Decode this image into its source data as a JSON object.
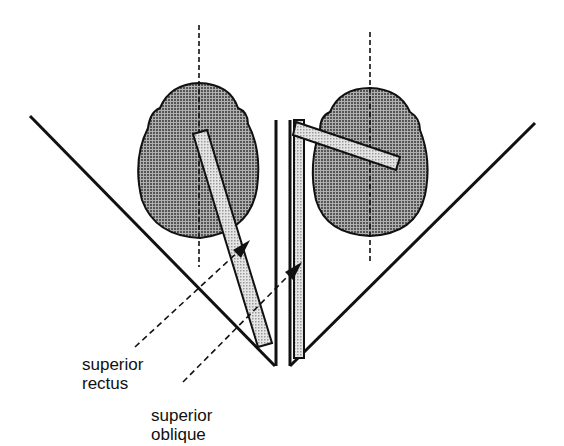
{
  "figure": {
    "type": "anatomical-diagram",
    "colors": {
      "outline": "#111111",
      "eyeball_fill": "#8a8a8a",
      "muscle_fill": "#d0d0d0",
      "background": "#ffffff"
    }
  },
  "labels": {
    "superior_rectus_line1": "superior",
    "superior_rectus_line2": "rectus",
    "superior_oblique_line1": "superior",
    "superior_oblique_line2": "oblique"
  }
}
